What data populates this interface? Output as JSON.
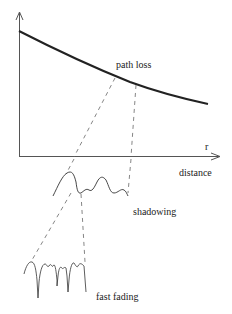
{
  "diagram": {
    "labels": {
      "path_loss": "path loss",
      "axis_r": "r",
      "distance": "distance",
      "shadowing": "shadowing",
      "fast_fading": "fast fading"
    },
    "colors": {
      "curve": "#222222",
      "axis": "#555555",
      "dashed": "#666666",
      "text": "#222222"
    }
  }
}
